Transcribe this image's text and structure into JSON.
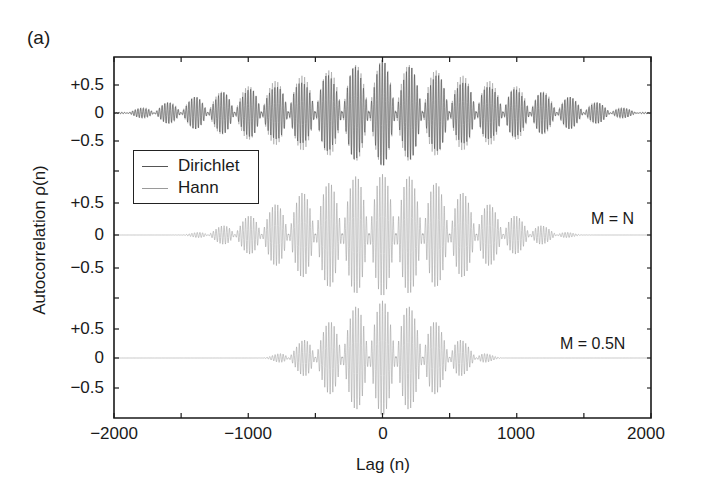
{
  "figure": {
    "panel_label": "(a)",
    "xlabel": "Lag (n)",
    "ylabel": "Autocorrelation ρ(n)",
    "xticks": [
      {
        "value": -2000,
        "label": "−2000"
      },
      {
        "value": -1000,
        "label": "−1000"
      },
      {
        "value": 0,
        "label": "0"
      },
      {
        "value": 1000,
        "label": "1000"
      },
      {
        "value": 2000,
        "label": "2000"
      }
    ],
    "legend": {
      "items": [
        {
          "label": "Dirichlet",
          "color": "#555555"
        },
        {
          "label": "Hann",
          "color": "#9a9a9a"
        }
      ]
    },
    "annotations": [
      {
        "text": "M = N",
        "panel": 1
      },
      {
        "text": "M = 0.5N",
        "panel": 2
      }
    ]
  },
  "chart_data": {
    "type": "line",
    "title": "",
    "xlabel": "Lag (n)",
    "ylabel": "Autocorrelation ρ(n)",
    "xlim": [
      -2000,
      2000
    ],
    "xticks": [
      -2000,
      -1500,
      -1000,
      -500,
      0,
      500,
      1000,
      1500,
      2000
    ],
    "xtick_labels": [
      "−2000",
      "",
      "−1000",
      "",
      "0",
      "",
      "1000",
      "",
      "2000"
    ],
    "grid": false,
    "legend_position": "upper-left (inside top panel)",
    "panels": [
      {
        "name": "top",
        "ylim": [
          -0.8,
          0.9
        ],
        "yticks": [
          -0.5,
          0,
          0.5
        ],
        "ytick_labels": [
          "−0.5",
          "0",
          "+0.5"
        ],
        "annotation": "",
        "series": [
          {
            "name": "Hann",
            "color": "#9a9a9a",
            "envelope": "triangular",
            "support": [
              -2000,
              2000
            ],
            "peak": 0.95,
            "lobe_spacing": 200,
            "carrier_period": 10
          },
          {
            "name": "Dirichlet",
            "color": "#4a4a4a",
            "envelope": "triangular",
            "support": [
              -2000,
              2000
            ],
            "peak": 0.95,
            "lobe_spacing": 200,
            "carrier_period": 10
          }
        ]
      },
      {
        "name": "middle",
        "ylim": [
          -0.9,
          0.9
        ],
        "yticks": [
          -0.5,
          0,
          0.5
        ],
        "ytick_labels": [
          "−0.5",
          "0",
          "+0.5"
        ],
        "annotation": "M = N",
        "series": [
          {
            "name": "Hann",
            "color": "#9a9a9a",
            "envelope": "smooth-taper",
            "support": [
              -1600,
              1600
            ],
            "peak": 0.95,
            "lobe_spacing": 200,
            "carrier_period": 10
          }
        ]
      },
      {
        "name": "bottom",
        "ylim": [
          -0.95,
          0.95
        ],
        "yticks": [
          -0.5,
          0,
          0.5
        ],
        "ytick_labels": [
          "−0.5",
          "0",
          "+0.5"
        ],
        "annotation": "M = 0.5N",
        "series": [
          {
            "name": "Hann",
            "color": "#9a9a9a",
            "envelope": "smooth-taper",
            "support": [
              -950,
              950
            ],
            "peak": 0.97,
            "lobe_spacing": 200,
            "carrier_period": 10
          }
        ]
      }
    ],
    "legend": [
      "Dirichlet",
      "Hann"
    ],
    "annotations": [
      "M = N",
      "M = 0.5N"
    ]
  }
}
